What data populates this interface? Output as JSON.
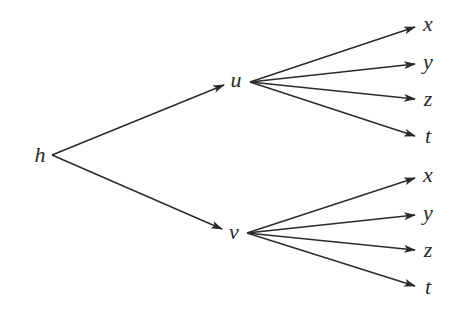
{
  "diagram": {
    "type": "tree",
    "root": {
      "label": "h"
    },
    "level1": [
      {
        "label": "u",
        "children": [
          "x",
          "y",
          "z",
          "t"
        ]
      },
      {
        "label": "v",
        "children": [
          "x",
          "y",
          "z",
          "t"
        ]
      }
    ],
    "edges": [
      [
        "h",
        "u"
      ],
      [
        "h",
        "v"
      ],
      [
        "u",
        "x"
      ],
      [
        "u",
        "y"
      ],
      [
        "u",
        "z"
      ],
      [
        "u",
        "t"
      ],
      [
        "v",
        "x"
      ],
      [
        "v",
        "y"
      ],
      [
        "v",
        "z"
      ],
      [
        "v",
        "t"
      ]
    ]
  },
  "labels": {
    "h": "h",
    "u": "u",
    "v": "v",
    "u_children": [
      "x",
      "y",
      "z",
      "t"
    ],
    "v_children": [
      "x",
      "y",
      "z",
      "t"
    ]
  }
}
